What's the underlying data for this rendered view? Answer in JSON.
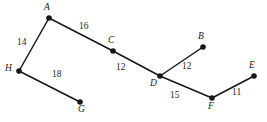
{
  "figure": {
    "background_color": "#ffffff",
    "edge_color": "#161616",
    "vertex_color": "#161616",
    "text_color": "#1a1a1a",
    "width": 267,
    "height": 122
  },
  "chart_data": {
    "type": "diagram",
    "subtype": "weighted-undirected-graph",
    "title": "",
    "xlabel": "",
    "ylabel": "",
    "grid": false,
    "legend": null,
    "nodes": [
      {
        "id": "A",
        "label": "A",
        "x": 49,
        "y": 18,
        "label_x": 44,
        "label_y": 3,
        "label_pos": "above"
      },
      {
        "id": "B",
        "label": "B",
        "x": 203,
        "y": 47,
        "label_x": 198,
        "label_y": 32,
        "label_pos": "above-left"
      },
      {
        "id": "C",
        "label": "C",
        "x": 113,
        "y": 51,
        "label_x": 108,
        "label_y": 36,
        "label_pos": "above"
      },
      {
        "id": "D",
        "label": "D",
        "x": 160,
        "y": 76,
        "label_x": 150,
        "label_y": 79,
        "label_pos": "below-left"
      },
      {
        "id": "E",
        "label": "E",
        "x": 254,
        "y": 76,
        "label_x": 249,
        "label_y": 61,
        "label_pos": "above-left"
      },
      {
        "id": "F",
        "label": "F",
        "x": 212,
        "y": 98,
        "label_x": 208,
        "label_y": 102,
        "label_pos": "below"
      },
      {
        "id": "G",
        "label": "G",
        "x": 80,
        "y": 102,
        "label_x": 78,
        "label_y": 105,
        "label_pos": "below-right"
      },
      {
        "id": "H",
        "label": "H",
        "x": 19,
        "y": 71,
        "label_x": 5,
        "label_y": 64,
        "label_pos": "left"
      }
    ],
    "edges": [
      {
        "source": "A",
        "target": "H",
        "weight": 14,
        "label": "14",
        "label_x": 17,
        "label_y": 38
      },
      {
        "source": "A",
        "target": "C",
        "weight": 16,
        "label": "16",
        "label_x": 79,
        "label_y": 22
      },
      {
        "source": "C",
        "target": "D",
        "weight": 12,
        "label": "12",
        "label_x": 116,
        "label_y": 63
      },
      {
        "source": "D",
        "target": "B",
        "weight": 12,
        "label": "12",
        "label_x": 182,
        "label_y": 62
      },
      {
        "source": "D",
        "target": "F",
        "weight": 15,
        "label": "15",
        "label_x": 170,
        "label_y": 91
      },
      {
        "source": "F",
        "target": "E",
        "weight": 11,
        "label": "11",
        "label_x": 232,
        "label_y": 88
      },
      {
        "source": "H",
        "target": "G",
        "weight": 18,
        "label": "18",
        "label_x": 52,
        "label_y": 70
      }
    ],
    "node_labels": [
      "A",
      "B",
      "C",
      "D",
      "E",
      "F",
      "G",
      "H"
    ],
    "edge_weights": [
      14,
      16,
      12,
      12,
      15,
      11,
      18
    ]
  }
}
